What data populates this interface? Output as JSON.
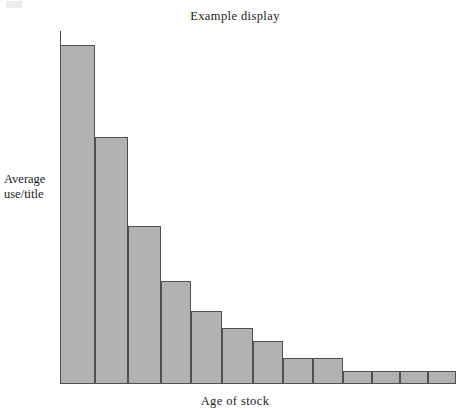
{
  "chart_data": {
    "type": "bar",
    "title": "Example display",
    "xlabel": "Age of stock",
    "ylabel_line1": "Average",
    "ylabel_line2": "use/title",
    "ylabel": "Average use/title",
    "grid": false,
    "legend": null,
    "axis_ticks": false,
    "tick_labels": false,
    "categories": [
      "1",
      "2",
      "3",
      "4",
      "5",
      "6",
      "7",
      "8",
      "9",
      "10",
      "11",
      "12",
      "13"
    ],
    "values": [
      96,
      70,
      45,
      29,
      21,
      16,
      12,
      7,
      7,
      3.5,
      3.5,
      3.5,
      3.5
    ],
    "ylim": [
      0,
      100
    ],
    "bar_color": "#b2b2b2",
    "bar_edge_color": "#4f4f4f",
    "axis_color": "#4a4a4a",
    "text_color": "#1a1a1a",
    "bars": [
      {
        "label": "1",
        "value": 96,
        "x": 60,
        "width": 35,
        "top": 45
      },
      {
        "label": "2",
        "value": 70,
        "x": 95,
        "width": 33,
        "top": 137
      },
      {
        "label": "3",
        "value": 45,
        "x": 128,
        "width": 33,
        "top": 226
      },
      {
        "label": "4",
        "value": 29,
        "x": 161,
        "width": 30,
        "top": 281
      },
      {
        "label": "5",
        "value": 21,
        "x": 191,
        "width": 31,
        "top": 311
      },
      {
        "label": "6",
        "value": 16,
        "x": 222,
        "width": 31,
        "top": 328
      },
      {
        "label": "7",
        "value": 12,
        "x": 253,
        "width": 30,
        "top": 341
      },
      {
        "label": "8",
        "value": 7,
        "x": 283,
        "width": 30,
        "top": 358
      },
      {
        "label": "9",
        "value": 7,
        "x": 313,
        "width": 30,
        "top": 358
      },
      {
        "label": "10",
        "value": 3.5,
        "x": 343,
        "width": 29,
        "top": 371
      },
      {
        "label": "11",
        "value": 3.5,
        "x": 372,
        "width": 28,
        "top": 371
      },
      {
        "label": "12",
        "value": 3.5,
        "x": 400,
        "width": 28,
        "top": 371
      },
      {
        "label": "13",
        "value": 3.5,
        "x": 428,
        "width": 28,
        "top": 371
      }
    ]
  }
}
